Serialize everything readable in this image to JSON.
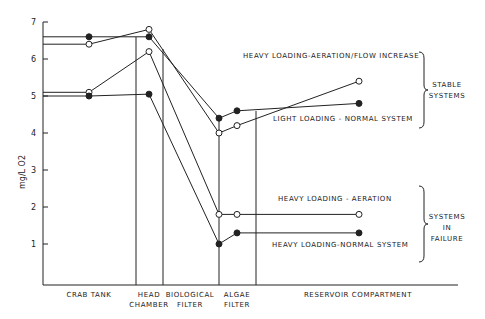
{
  "chart_data": {
    "type": "line",
    "title": "",
    "ylabel": "mg/L O2",
    "xlabel": "",
    "ylim": [
      0,
      7
    ],
    "yticks": [
      1,
      2,
      3,
      4,
      5,
      6,
      7
    ],
    "grid": false,
    "compartments": [
      {
        "label_line1": "CRAB TANK",
        "label_line2": ""
      },
      {
        "label_line1": "HEAD",
        "label_line2": "CHAMBER"
      },
      {
        "label_line1": "BIOLOGICAL",
        "label_line2": "FILTER"
      },
      {
        "label_line1": "ALGAE",
        "label_line2": "FILTER"
      },
      {
        "label_line1": "RESERVOIR COMPARTMENT",
        "label_line2": ""
      }
    ],
    "x": [
      "Crab tank",
      "Head chamber",
      "Algae filter (in)",
      "Algae filter (out)",
      "Reservoir compartment"
    ],
    "series": [
      {
        "name": "HEAVY LOADING-AERATION/FLOW INCREASE",
        "marker": "open",
        "values": [
          6.4,
          6.8,
          4.0,
          4.2,
          5.4
        ]
      },
      {
        "name": "LIGHT LOADING - NORMAL SYSTEM",
        "marker": "filled",
        "values": [
          6.6,
          6.6,
          4.4,
          4.6,
          4.8
        ]
      },
      {
        "name": "HEAVY LOADING - AERATION",
        "marker": "open",
        "values": [
          5.1,
          6.2,
          1.8,
          1.8,
          1.8
        ]
      },
      {
        "name": "HEAVY LOADING-NORMAL SYSTEM",
        "marker": "filled",
        "values": [
          5.0,
          5.05,
          1.0,
          1.3,
          1.3
        ]
      }
    ],
    "groups": [
      {
        "label": [
          "STABLE",
          "SYSTEMS"
        ]
      },
      {
        "label": [
          "SYSTEMS",
          "IN",
          "FAILURE"
        ]
      }
    ]
  }
}
